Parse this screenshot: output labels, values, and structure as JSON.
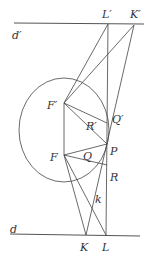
{
  "diagram": {
    "labels": {
      "d_prime": "d′",
      "L_prime": "L′",
      "K_prime": "K′",
      "F_prime": "F′",
      "Q_prime": "Q′",
      "R_prime": "R′",
      "F": "F",
      "Q": "Q",
      "P": "P",
      "R": "R",
      "k": "k",
      "d": "d",
      "K": "K",
      "L": "L"
    },
    "colors": {
      "stroke": "#444444",
      "text": "#333333",
      "background": "#ffffff"
    }
  }
}
